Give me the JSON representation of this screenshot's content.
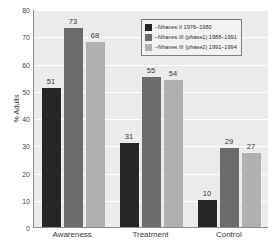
{
  "chart_data": {
    "type": "bar",
    "title": "",
    "xlabel": "",
    "ylabel": "% Adults",
    "ylim": [
      0,
      80
    ],
    "ytick_step": 10,
    "yticks": [
      80,
      70,
      60,
      50,
      40,
      30,
      20,
      10,
      0
    ],
    "grid": true,
    "grid_axis": "y",
    "legend_position": "top-right",
    "categories": [
      "Awareness",
      "Treatment",
      "Control"
    ],
    "series": [
      {
        "name": "–Nhanes II 1976–1980",
        "color": "#262626",
        "values": [
          51,
          31,
          10
        ]
      },
      {
        "name": "–Nhanes III (phase1) 1988–1991",
        "color": "#6b6b6b",
        "values": [
          73,
          55,
          29
        ]
      },
      {
        "name": "–Nhanes III (phase2) 1991–1994",
        "color": "#b0b0b0",
        "values": [
          68,
          54,
          27
        ]
      }
    ]
  },
  "colors": {
    "series_1": "#262626",
    "series_2": "#6b6b6b",
    "series_3": "#b0b0b0",
    "plot_background": "#ebebeb",
    "gridline": "#ffffff",
    "axis": "#8e8e8e",
    "legend_background": "#f2f2f2",
    "legend_border": "#7d7d7d",
    "text": "#3a3a3a"
  }
}
